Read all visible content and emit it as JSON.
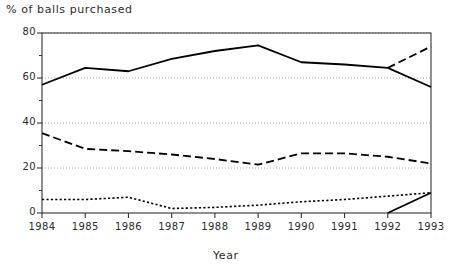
{
  "chart_data": {
    "type": "line",
    "title": "",
    "ylabel": "% of balls purchased",
    "xlabel": "Year",
    "categories": [
      "1984",
      "1985",
      "1986",
      "1987",
      "1988",
      "1989",
      "1990",
      "1991",
      "1992",
      "1993"
    ],
    "x": [
      1984,
      1985,
      1986,
      1987,
      1988,
      1989,
      1990,
      1991,
      1992,
      1993
    ],
    "xlim": [
      1984,
      1993
    ],
    "ylim": [
      0,
      80
    ],
    "yticks": [
      0,
      20,
      40,
      60,
      80
    ],
    "yticklabels": [
      "0",
      "20",
      "40",
      "60",
      "80"
    ],
    "yminorticks": [
      10,
      30,
      50,
      70
    ],
    "xticklabels": [
      "1984",
      "1985",
      "1986",
      "1987",
      "1988",
      "1989",
      "1990",
      "1991",
      "1992",
      "1993"
    ],
    "grid": true,
    "gridstyle": "dotted",
    "legend": "none",
    "series": [
      {
        "name": "top-series",
        "style": "solid",
        "x": [
          1984,
          1985,
          1986,
          1987,
          1988,
          1989,
          1990,
          1991,
          1992,
          1993
        ],
        "values": [
          57,
          64.5,
          63,
          68.5,
          72,
          74.5,
          67,
          66,
          64.5,
          56
        ]
      },
      {
        "name": "top-series-branch",
        "style": "dashed",
        "x": [
          1992,
          1993
        ],
        "values": [
          64.5,
          74
        ]
      },
      {
        "name": "middle-series",
        "style": "dashed",
        "x": [
          1984,
          1985,
          1986,
          1987,
          1988,
          1989,
          1990,
          1991,
          1992,
          1993
        ],
        "values": [
          35.5,
          28.5,
          27.5,
          26,
          24,
          21.5,
          26.5,
          26.5,
          25,
          22
        ]
      },
      {
        "name": "bottom-series",
        "style": "dotted",
        "x": [
          1984,
          1985,
          1986,
          1987,
          1988,
          1989,
          1990,
          1991,
          1992,
          1993
        ],
        "values": [
          6,
          6,
          7,
          2,
          2.5,
          3.5,
          5,
          6,
          7.5,
          9
        ]
      },
      {
        "name": "bottom-series-branch",
        "style": "solid",
        "x": [
          1992,
          1993
        ],
        "values": [
          0,
          9
        ]
      }
    ],
    "colors": {
      "line": "#000000",
      "axis": "#333333",
      "grid": "#9a9a9a",
      "text": "#2b2b2b",
      "background": "#ffffff"
    }
  },
  "plot_geometry": {
    "left": 42,
    "right": 431,
    "top": 33,
    "bottom": 213
  }
}
